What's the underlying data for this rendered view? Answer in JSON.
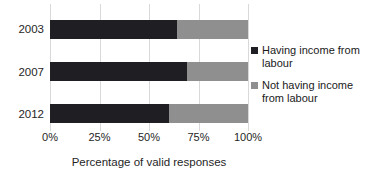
{
  "chart_data": {
    "type": "bar",
    "orientation": "horizontal",
    "stacked": true,
    "categories": [
      "2003",
      "2007",
      "2012"
    ],
    "series": [
      {
        "name": "Having income from labour",
        "values": [
          64,
          69,
          60
        ],
        "color": "#1f1f23"
      },
      {
        "name": "Not having income from labour",
        "values": [
          36,
          31,
          40
        ],
        "color": "#8f8f8f"
      }
    ],
    "xlabel": "Percentage of valid responses",
    "x_ticks": [
      "0%",
      "25%",
      "50%",
      "75%",
      "100%"
    ],
    "xlim": [
      0,
      100
    ],
    "grid": true,
    "legend_position": "right",
    "gridline_color": "#d9d9d9",
    "text_color": "#262626",
    "background": "#ffffff"
  }
}
